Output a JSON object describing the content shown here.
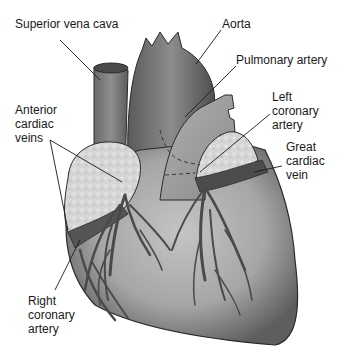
{
  "diagram": {
    "labels": {
      "superior_vena_cava": "Superior vena cava",
      "aorta": "Aorta",
      "pulmonary_artery": "Pulmonary artery",
      "anterior_cardiac_veins": "Anterior\ncardiac\nveins",
      "left_coronary_artery": "Left\ncoronary\nartery",
      "great_cardiac_vein": "Great\ncardiac\nvein",
      "right_coronary_artery": "Right\ncoronary\nartery"
    },
    "colors": {
      "heart_body": "#a9a9a9",
      "heart_shadow": "#6e6e6e",
      "vessel": "#555555",
      "fat_tissue": "#d8d8d8",
      "outline": "#2a2a2a",
      "leader_line": "#1a1a1a"
    }
  }
}
